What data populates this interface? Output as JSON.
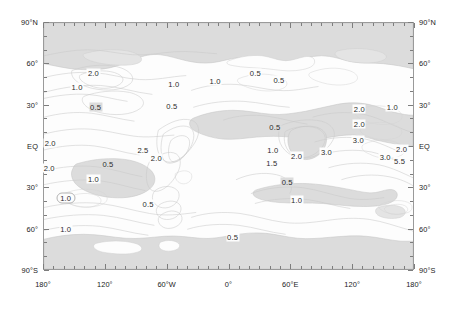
{
  "figure": {
    "type": "contour-map",
    "projection": "equirectangular",
    "background_color": "#ffffff",
    "plot_background_color": "#fdfdfd",
    "shade_color": "#dcdcdc",
    "contour_color": "#bdbdbd",
    "frame_color": "#9a9a9a"
  },
  "axes": {
    "latitude_labels": [
      {
        "text": "90°N",
        "value": 90
      },
      {
        "text": "60°",
        "value": 60
      },
      {
        "text": "30°",
        "value": 30
      },
      {
        "text": "EQ",
        "value": 0
      },
      {
        "text": "30°",
        "value": -30
      },
      {
        "text": "60°",
        "value": -60
      },
      {
        "text": "90°S",
        "value": -90
      }
    ],
    "longitude_labels": [
      {
        "text": "180°",
        "value": -180
      },
      {
        "text": "120°",
        "value": -120
      },
      {
        "text": "60°W",
        "value": -60
      },
      {
        "text": "0°",
        "value": 0
      },
      {
        "text": "60°E",
        "value": 60
      },
      {
        "text": "120°",
        "value": 120
      },
      {
        "text": "180°",
        "value": 180
      }
    ],
    "lat_range": [
      -90,
      90
    ],
    "lon_range": [
      -180,
      180
    ],
    "lat_major_step": 30,
    "lat_minor_step": 10,
    "lon_major_step": 60,
    "lon_minor_step": 10
  },
  "chart_data": {
    "type": "contour",
    "title": "",
    "xlabel": "",
    "ylabel": "",
    "xlim": [
      -180,
      180
    ],
    "ylim": [
      -90,
      90
    ],
    "grid": false,
    "legend": "none",
    "contour_levels": [
      0.5,
      1.0,
      1.5,
      2.0,
      2.5,
      3.0,
      5.5
    ],
    "labels": [
      {
        "text": "2.0",
        "lon": -131,
        "lat": 53,
        "shaded": false,
        "boxed": false
      },
      {
        "text": "1.0",
        "lon": -147,
        "lat": 43,
        "shaded": false,
        "boxed": false
      },
      {
        "text": "0.5",
        "lon": -129,
        "lat": 28,
        "shaded": true,
        "boxed": false
      },
      {
        "text": "1.0",
        "lon": -53,
        "lat": 45,
        "shaded": false,
        "boxed": false
      },
      {
        "text": "0.5",
        "lon": -55,
        "lat": 29,
        "shaded": false,
        "boxed": false
      },
      {
        "text": "1.0",
        "lon": -13,
        "lat": 47,
        "shaded": false,
        "boxed": false
      },
      {
        "text": "0.5",
        "lon": 26,
        "lat": 53,
        "shaded": false,
        "boxed": false
      },
      {
        "text": "0.5",
        "lon": 49,
        "lat": 48,
        "shaded": false,
        "boxed": false
      },
      {
        "text": "2.0",
        "lon": 127,
        "lat": 27,
        "shaded": false,
        "boxed": false
      },
      {
        "text": "1.0",
        "lon": 159,
        "lat": 28,
        "shaded": false,
        "boxed": false
      },
      {
        "text": "2.0",
        "lon": 127,
        "lat": 16,
        "shaded": false,
        "boxed": false
      },
      {
        "text": "3.0",
        "lon": 126,
        "lat": 4,
        "shaded": false,
        "boxed": false
      },
      {
        "text": "0.5",
        "lon": 45,
        "lat": 14,
        "shaded": true,
        "boxed": false
      },
      {
        "text": "2.0",
        "lon": -173,
        "lat": 2,
        "shaded": false,
        "boxed": false
      },
      {
        "text": "2.5",
        "lon": -83,
        "lat": -3,
        "shaded": false,
        "boxed": false
      },
      {
        "text": "2.0",
        "lon": -70,
        "lat": -9,
        "shaded": false,
        "boxed": false
      },
      {
        "text": "1.0",
        "lon": 43,
        "lat": -3,
        "shaded": false,
        "boxed": false
      },
      {
        "text": "2.0",
        "lon": 66,
        "lat": -7,
        "shaded": false,
        "boxed": false
      },
      {
        "text": "3.0",
        "lon": 95,
        "lat": -4,
        "shaded": false,
        "boxed": false
      },
      {
        "text": "1.5",
        "lon": 42,
        "lat": -12,
        "shaded": false,
        "boxed": false
      },
      {
        "text": "3.0",
        "lon": 152,
        "lat": -8,
        "shaded": false,
        "boxed": false
      },
      {
        "text": "2.0",
        "lon": 168,
        "lat": -2,
        "shaded": false,
        "boxed": false
      },
      {
        "text": "5.5",
        "lon": 166,
        "lat": -11,
        "shaded": false,
        "boxed": false
      },
      {
        "text": "2.0",
        "lon": -174,
        "lat": -16,
        "shaded": false,
        "boxed": false
      },
      {
        "text": "0.5",
        "lon": -117,
        "lat": -13,
        "shaded": true,
        "boxed": false
      },
      {
        "text": "1.0",
        "lon": -131,
        "lat": -24,
        "shaded": false,
        "boxed": false
      },
      {
        "text": "1.0",
        "lon": -158,
        "lat": -38,
        "shaded": false,
        "boxed": true
      },
      {
        "text": "0.5",
        "lon": 57,
        "lat": -26,
        "shaded": true,
        "boxed": false
      },
      {
        "text": "1.0",
        "lon": 66,
        "lat": -39,
        "shaded": false,
        "boxed": false
      },
      {
        "text": "0.5",
        "lon": -78,
        "lat": -42,
        "shaded": false,
        "boxed": false
      },
      {
        "text": "1.0",
        "lon": -158,
        "lat": -60,
        "shaded": false,
        "boxed": false
      },
      {
        "text": "0.5",
        "lon": 4,
        "lat": -66,
        "shaded": false,
        "boxed": false
      }
    ]
  }
}
